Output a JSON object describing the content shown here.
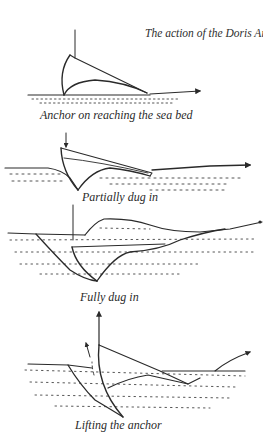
{
  "figure": {
    "caption_italic": "The action of the Doris Anchor.",
    "caption_credit": "(Author)",
    "ink_color": "#2a2a2a",
    "background": "#ffffff"
  },
  "stages": [
    {
      "id": "seabed",
      "label": "Anchor on reaching the sea bed"
    },
    {
      "id": "partial",
      "label": "Partially dug in"
    },
    {
      "id": "full",
      "label": "Fully dug in"
    },
    {
      "id": "lifting",
      "label": "Lifting the anchor"
    }
  ]
}
